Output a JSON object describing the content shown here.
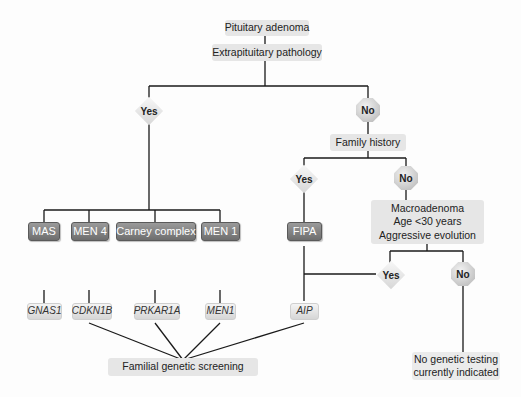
{
  "diagram": {
    "root": "Pituitary adenoma",
    "q1": "Extrapituitary pathology",
    "yes_label": "Yes",
    "no_label": "No",
    "q2": "Family history",
    "q3_lines": [
      "Macroadenoma",
      "Age <30 years",
      "Aggressive evolution"
    ],
    "syndromes": [
      "MAS",
      "MEN 4",
      "Carney complex",
      "MEN 1",
      "FIPA"
    ],
    "genes": [
      "GNAS1",
      "CDKN1B",
      "PRKAR1A",
      "MEN1",
      "AIP"
    ],
    "screening": "Familial  genetic screening",
    "no_testing_lines": [
      "No  genetic testing",
      "currently indicated"
    ]
  }
}
